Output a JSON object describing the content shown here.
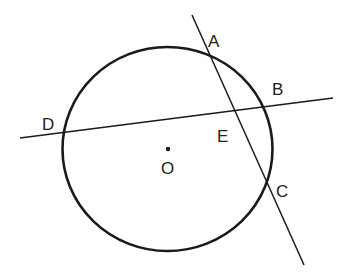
{
  "diagram": {
    "title": "",
    "circle": {
      "label": "O",
      "center": [
        167,
        149
      ],
      "radius": 104
    },
    "points": [
      {
        "id": "A",
        "label": "A"
      },
      {
        "id": "B",
        "label": "B"
      },
      {
        "id": "C",
        "label": "C"
      },
      {
        "id": "D",
        "label": "D"
      },
      {
        "id": "E",
        "label": "E"
      },
      {
        "id": "O",
        "label": "O"
      }
    ],
    "lines": [
      {
        "name": "line-AC",
        "through": [
          "A",
          "E",
          "C"
        ]
      },
      {
        "name": "line-DB",
        "through": [
          "D",
          "E",
          "B"
        ]
      }
    ],
    "colors": {
      "stroke": "#1a1a1a",
      "background": "#ffffff"
    }
  }
}
